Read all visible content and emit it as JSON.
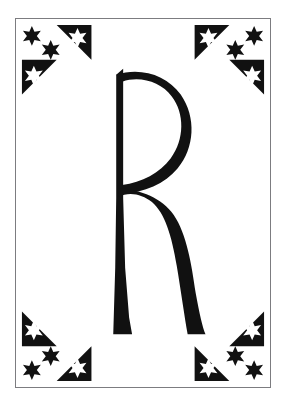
{
  "artwork": {
    "title": "Decorative Letter R",
    "letter": "R",
    "style": "Art Nouveau illuminated initial",
    "description": "Black ornamental capital letter R centered on a white plate, enclosed by a thin rectangular rule, with star-studded triangular ornaments in each of the four corners.",
    "medium": "black and white line art"
  },
  "colors": {
    "background": "#ffffff",
    "ink": "#111111",
    "frame_rule": "#7c7c80",
    "plate": "#ffffff",
    "star_fill_light": "#ffffff"
  },
  "frame": {
    "name": "border-rule",
    "x": 15,
    "y": 18,
    "width": 256,
    "height": 370,
    "stroke_width": 1
  },
  "letterform": {
    "glyph": "R",
    "bounds": {
      "x": 113,
      "y": 72,
      "width": 89,
      "height": 263
    },
    "parts": [
      {
        "name": "stem",
        "label": "vertical stem with flared foot"
      },
      {
        "name": "bowl",
        "label": "upper bowl, pointed apex"
      },
      {
        "name": "leg",
        "label": "curving tail leg with flared foot"
      }
    ]
  },
  "ornaments": [
    {
      "name": "corner-ornament-top-left",
      "position": "top-left",
      "large_triangle_stars": 1,
      "small_triangle_stars": 1,
      "floating_stars": 2
    },
    {
      "name": "corner-ornament-top-right",
      "position": "top-right",
      "large_triangle_stars": 1,
      "small_triangle_stars": 1,
      "floating_stars": 2
    },
    {
      "name": "corner-ornament-bottom-left",
      "position": "bottom-left",
      "large_triangle_stars": 1,
      "small_triangle_stars": 1,
      "floating_stars": 2
    },
    {
      "name": "corner-ornament-bottom-right",
      "position": "bottom-right",
      "large_triangle_stars": 1,
      "small_triangle_stars": 1,
      "floating_stars": 2
    }
  ]
}
